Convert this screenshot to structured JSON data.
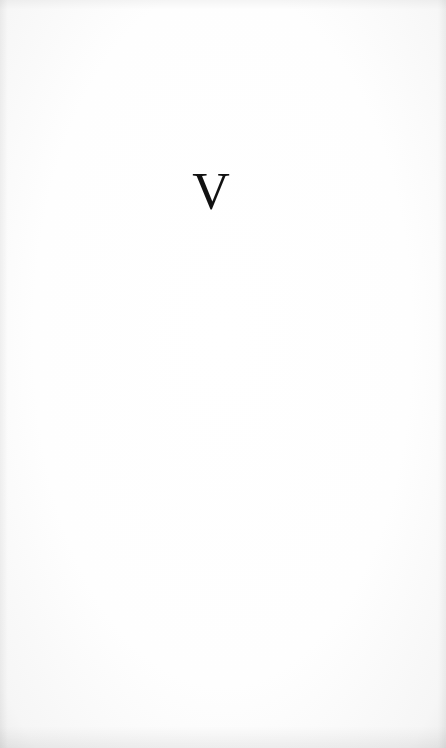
{
  "page": {
    "heading": "V",
    "background_color": "#fdfdfd",
    "text_color": "#111111"
  }
}
